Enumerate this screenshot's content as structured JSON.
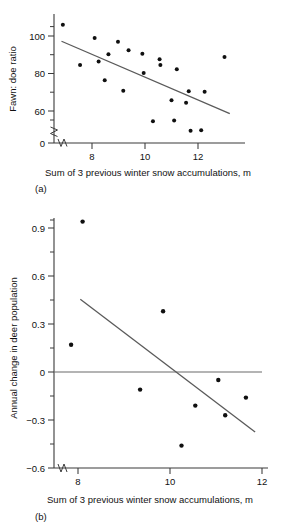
{
  "figure": {
    "shared_xlabel": "Sum of 3 previous winter snow accumulations, m"
  },
  "chart_data": [
    {
      "type": "scatter",
      "panel_label": "(a)",
      "title": "",
      "xlabel": "Sum of 3 previous winter snow accumulations, m",
      "ylabel": "Fawn: doe ratio",
      "xlim": [
        6.6,
        13.6
      ],
      "ylim": [
        52,
        110
      ],
      "y_axis_break": true,
      "y_break_between": [
        0,
        55
      ],
      "x_axis_break": true,
      "grid": false,
      "legend": null,
      "xticks": [
        8,
        10,
        12
      ],
      "xtick_labels": [
        "8",
        "10",
        "12"
      ],
      "yticks": [
        0,
        60,
        80,
        100
      ],
      "ytick_labels": [
        "0",
        "60",
        "80",
        "100"
      ],
      "y_minor_ticks": [
        70,
        90,
        105
      ],
      "points": [
        {
          "x": 6.9,
          "y": 106.0
        },
        {
          "x": 7.55,
          "y": 84.6
        },
        {
          "x": 8.1,
          "y": 99.0
        },
        {
          "x": 8.25,
          "y": 86.4
        },
        {
          "x": 8.48,
          "y": 76.4
        },
        {
          "x": 8.62,
          "y": 90.3
        },
        {
          "x": 8.98,
          "y": 97.0
        },
        {
          "x": 9.18,
          "y": 70.8
        },
        {
          "x": 9.38,
          "y": 92.4
        },
        {
          "x": 9.9,
          "y": 90.5
        },
        {
          "x": 9.95,
          "y": 80.3
        },
        {
          "x": 10.3,
          "y": 54.5
        },
        {
          "x": 10.55,
          "y": 87.6
        },
        {
          "x": 10.58,
          "y": 84.6
        },
        {
          "x": 11.0,
          "y": 65.8
        },
        {
          "x": 11.1,
          "y": 55.0
        },
        {
          "x": 11.2,
          "y": 82.3
        },
        {
          "x": 11.55,
          "y": 64.4
        },
        {
          "x": 11.65,
          "y": 70.5
        },
        {
          "x": 11.72,
          "y": 49.5
        },
        {
          "x": 12.12,
          "y": 49.8
        },
        {
          "x": 12.25,
          "y": 70.3
        },
        {
          "x": 13.0,
          "y": 88.8
        }
      ],
      "fit_line": {
        "x1": 6.85,
        "y1": 97.2,
        "x2": 13.2,
        "y2": 58.6
      }
    },
    {
      "type": "scatter",
      "panel_label": "(b)",
      "title": "",
      "xlabel": "Sum of 3 previous winter snow accumulations, m",
      "ylabel": "Annual change in deer population",
      "xlim": [
        7.4,
        12.2
      ],
      "ylim": [
        -0.6,
        1.05
      ],
      "y_axis_break": true,
      "x_axis_break": true,
      "grid": false,
      "legend": null,
      "xticks": [
        8,
        10,
        12
      ],
      "xtick_labels": [
        "8",
        "10",
        "12"
      ],
      "yticks": [
        -0.6,
        -0.3,
        0,
        0.3,
        0.6,
        0.9
      ],
      "ytick_labels": [
        "−0.6",
        "−0.3",
        "0",
        "0.3",
        "0.6",
        "0.9"
      ],
      "y_minor_ticks": [
        -0.45,
        -0.15,
        0.15,
        0.45,
        0.75,
        1.0
      ],
      "zero_reference_line": 0,
      "points": [
        {
          "x": 7.85,
          "y": 0.17
        },
        {
          "x": 8.1,
          "y": 0.94
        },
        {
          "x": 9.35,
          "y": -0.11
        },
        {
          "x": 9.85,
          "y": 0.38
        },
        {
          "x": 10.25,
          "y": -0.46
        },
        {
          "x": 10.55,
          "y": -0.21
        },
        {
          "x": 11.05,
          "y": -0.05
        },
        {
          "x": 11.2,
          "y": -0.27
        },
        {
          "x": 11.65,
          "y": -0.16
        }
      ],
      "fit_line": {
        "x1": 8.05,
        "y1": 0.455,
        "x2": 11.85,
        "y2": -0.375
      }
    }
  ]
}
